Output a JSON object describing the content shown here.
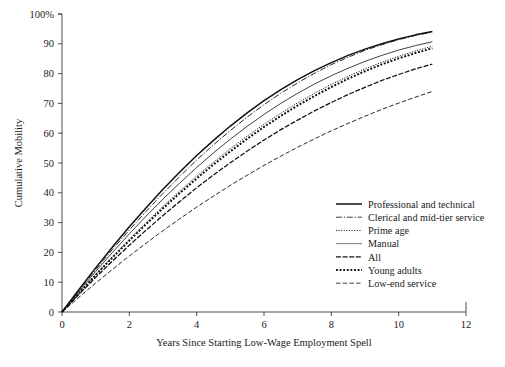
{
  "chart_data": {
    "type": "line",
    "title": "",
    "xlabel": "Years Since Starting Low-Wage Employment Spell",
    "ylabel": "Cumulative Mobility",
    "xlim": [
      0,
      12
    ],
    "ylim": [
      0,
      100
    ],
    "xticks": [
      0,
      2,
      4,
      6,
      8,
      10,
      12
    ],
    "xtick_labels": [
      "0",
      "2",
      "4",
      "6",
      "8",
      "10",
      "12"
    ],
    "yticks": [
      0,
      10,
      20,
      30,
      40,
      50,
      60,
      70,
      80,
      90,
      100
    ],
    "ytick_labels": [
      "0",
      "10",
      "20",
      "30",
      "40",
      "50",
      "60",
      "70",
      "80",
      "90",
      "100%"
    ],
    "grid": false,
    "legend_position": "center-right",
    "x": [
      0,
      0.5,
      1,
      1.5,
      2,
      2.5,
      3,
      3.5,
      4,
      4.5,
      5,
      5.5,
      6,
      6.5,
      7,
      7.5,
      8,
      8.5,
      9,
      9.5,
      10,
      10.5,
      11
    ],
    "series": [
      {
        "name": "Professional and technical",
        "style": "solid-thick",
        "color": "#101010",
        "values": [
          0,
          7.5,
          14.8,
          21.8,
          28.6,
          35.0,
          41.2,
          47.0,
          52.5,
          57.6,
          62.4,
          66.8,
          70.9,
          74.6,
          78.0,
          81.0,
          83.7,
          86.1,
          88.2,
          90.0,
          91.6,
          93.0,
          94.1
        ]
      },
      {
        "name": "Clerical and mid-tier service",
        "style": "dash-dot",
        "color": "#2a2a2a",
        "values": [
          0,
          7.2,
          14.2,
          21.0,
          27.5,
          33.8,
          39.8,
          45.5,
          51.0,
          56.1,
          60.9,
          65.4,
          69.6,
          73.4,
          76.9,
          80.1,
          83.0,
          85.5,
          87.8,
          89.7,
          91.4,
          92.8,
          93.9
        ]
      },
      {
        "name": "Prime age",
        "style": "fine-dotted",
        "color": "#1c1c1c",
        "values": [
          0,
          6.4,
          12.6,
          18.6,
          24.4,
          30.0,
          35.4,
          40.6,
          45.6,
          50.3,
          54.8,
          59.0,
          63.0,
          66.7,
          70.2,
          73.4,
          76.4,
          79.1,
          81.6,
          83.8,
          85.8,
          87.6,
          89.2
        ]
      },
      {
        "name": "Manual",
        "style": "thin-solid",
        "color": "#555555",
        "values": [
          0,
          6.9,
          13.6,
          20.0,
          26.2,
          32.2,
          37.9,
          43.3,
          48.5,
          53.4,
          58.0,
          62.3,
          66.3,
          70.0,
          73.4,
          76.5,
          79.3,
          81.8,
          84.1,
          86.1,
          87.9,
          89.4,
          90.7
        ]
      },
      {
        "name": "All",
        "style": "medium-dash",
        "color": "#171717",
        "values": [
          0,
          5.9,
          11.6,
          17.1,
          22.4,
          27.5,
          32.4,
          37.1,
          41.7,
          46.0,
          50.1,
          54.0,
          57.7,
          61.2,
          64.4,
          67.5,
          70.3,
          73.0,
          75.4,
          77.7,
          79.7,
          81.6,
          83.2
        ]
      },
      {
        "name": "Young adults",
        "style": "heavy-dotted",
        "color": "#1a1a1a",
        "values": [
          0,
          6.3,
          12.4,
          18.3,
          24.0,
          29.5,
          34.8,
          39.9,
          44.8,
          49.5,
          53.9,
          58.1,
          62.1,
          65.8,
          69.3,
          72.5,
          75.5,
          78.3,
          80.8,
          83.1,
          85.1,
          86.9,
          88.5
        ]
      },
      {
        "name": "Low-end service",
        "style": "long-dash",
        "color": "#303030",
        "values": [
          0,
          4.9,
          9.7,
          14.3,
          18.8,
          23.1,
          27.3,
          31.3,
          35.2,
          38.9,
          42.5,
          45.9,
          49.2,
          52.3,
          55.3,
          58.1,
          60.8,
          63.3,
          65.7,
          68.0,
          70.1,
          72.1,
          74.0
        ]
      }
    ]
  },
  "legend": {
    "items": [
      {
        "label": "Professional and technical"
      },
      {
        "label": "Clerical and mid-tier service"
      },
      {
        "label": "Prime age"
      },
      {
        "label": "Manual"
      },
      {
        "label": "All"
      },
      {
        "label": "Young adults"
      },
      {
        "label": "Low-end service"
      }
    ]
  }
}
